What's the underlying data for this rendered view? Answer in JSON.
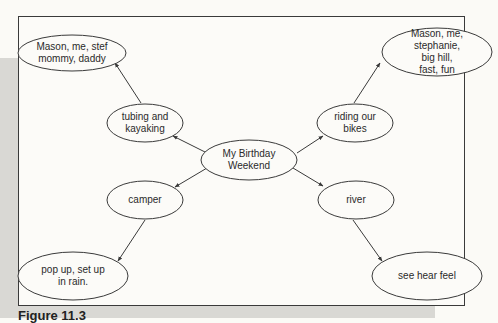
{
  "diagram": {
    "type": "web / cluster map",
    "center": {
      "id": "center",
      "label": "My Birthday\nWeekend",
      "cx": 249,
      "cy": 160,
      "rx": 48,
      "ry": 20
    },
    "nodes": [
      {
        "id": "tubing",
        "label": "tubing and\nkayaking",
        "cx": 145,
        "cy": 123,
        "rx": 38,
        "ry": 19
      },
      {
        "id": "tubing-detail",
        "label": "Mason, me, stef\nmommy, daddy",
        "cx": 72,
        "cy": 53,
        "rx": 54,
        "ry": 18
      },
      {
        "id": "bikes",
        "label": "riding our\nbikes",
        "cx": 355,
        "cy": 123,
        "rx": 38,
        "ry": 19
      },
      {
        "id": "bikes-detail",
        "label": "Mason, me,\nstephanie, big hill,\nfast, fun",
        "cx": 437,
        "cy": 52,
        "rx": 55,
        "ry": 24
      },
      {
        "id": "camper",
        "label": "camper",
        "cx": 145,
        "cy": 200,
        "rx": 38,
        "ry": 19
      },
      {
        "id": "camper-detail",
        "label": "pop up, set up\nin rain.",
        "cx": 73,
        "cy": 276,
        "rx": 55,
        "ry": 24
      },
      {
        "id": "river",
        "label": "river",
        "cx": 356,
        "cy": 200,
        "rx": 38,
        "ry": 19
      },
      {
        "id": "river-detail",
        "label": "see hear feel",
        "cx": 427,
        "cy": 276,
        "rx": 55,
        "ry": 24
      }
    ],
    "edges": [
      {
        "from": "center",
        "to": "tubing",
        "x1": 207,
        "y1": 153,
        "x2": 173,
        "y2": 136
      },
      {
        "from": "tubing",
        "to": "tubing-detail",
        "x1": 141,
        "y1": 103,
        "x2": 115,
        "y2": 63
      },
      {
        "from": "center",
        "to": "bikes",
        "x1": 297,
        "y1": 153,
        "x2": 323,
        "y2": 136
      },
      {
        "from": "bikes",
        "to": "bikes-detail",
        "x1": 354,
        "y1": 103,
        "x2": 380,
        "y2": 63
      },
      {
        "from": "center",
        "to": "camper",
        "x1": 207,
        "y1": 168,
        "x2": 175,
        "y2": 187
      },
      {
        "from": "camper",
        "to": "camper-detail",
        "x1": 145,
        "y1": 220,
        "x2": 118,
        "y2": 261
      },
      {
        "from": "center",
        "to": "river",
        "x1": 293,
        "y1": 168,
        "x2": 323,
        "y2": 186
      },
      {
        "from": "river",
        "to": "river-detail",
        "x1": 353,
        "y1": 220,
        "x2": 382,
        "y2": 261
      }
    ],
    "colors": {
      "line": "#3a3a3a",
      "text": "#2a2a2a",
      "frame_bg": "#fcfbf8",
      "page_gray": "#d9d8d4"
    }
  },
  "caption": {
    "text": "Figure 11.3"
  }
}
